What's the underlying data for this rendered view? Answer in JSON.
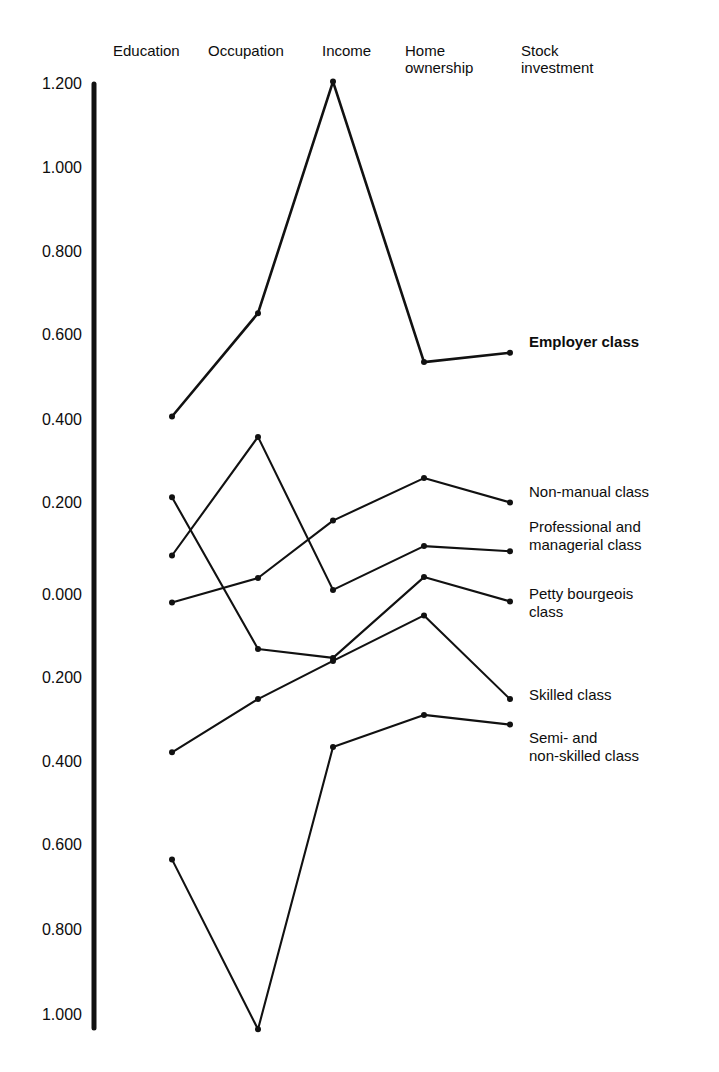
{
  "chart_data": {
    "type": "line",
    "title": "",
    "subtitle": "",
    "xlabel": "",
    "ylabel": "",
    "grid": false,
    "legend_position": "right-of-plot-line-ends",
    "categories": [
      "Education",
      "Occupation",
      "Income",
      "Home ownership",
      "Stock investment"
    ],
    "category_labels_multiline": [
      "Education",
      "Occupation",
      "Income",
      "Home\nownership",
      "Stock\ninvestment"
    ],
    "yticks": [
      "1.200",
      "1.000",
      "0.800",
      "0.600",
      "0.400",
      "0.200",
      "0.000",
      "-0.200",
      "-0.400",
      "-0.600",
      "-0.800",
      "-1.000"
    ],
    "ytick_values": [
      1.2,
      1.0,
      0.8,
      0.6,
      0.4,
      0.2,
      0.0,
      -0.2,
      -0.4,
      -0.6,
      -0.8,
      -1.0
    ],
    "ytick_display": [
      "1.200",
      "1.000",
      "0.800",
      "0.600",
      "0.400",
      "0.200",
      "0.000",
      "0.200",
      "0.400",
      "0.600",
      "0.800",
      "1.000"
    ],
    "ylim": [
      -1.06,
      1.25
    ],
    "axis_color": "#111111",
    "line_color": "#111111",
    "series": [
      {
        "name": "Employer class",
        "bold": true,
        "values": [
          0.42,
          0.663,
          1.208,
          0.548,
          0.57
        ]
      },
      {
        "name": "Non-manual class",
        "bold": false,
        "values": [
          -0.018,
          0.04,
          0.175,
          0.275,
          0.218
        ]
      },
      {
        "name": "Professional and managerial class",
        "bold": false,
        "values": [
          0.093,
          0.372,
          0.012,
          0.115,
          0.103
        ]
      },
      {
        "name": "Petty bourgeois class",
        "bold": false,
        "values": [
          0.23,
          -0.127,
          -0.148,
          0.042,
          -0.015
        ]
      },
      {
        "name": "Skilled class",
        "bold": false,
        "values": [
          -0.37,
          -0.245,
          -0.155,
          -0.048,
          -0.245
        ]
      },
      {
        "name": "Semi- and non-skilled class",
        "bold": false,
        "values": [
          -0.622,
          -1.022,
          -0.358,
          -0.282,
          -0.305
        ]
      }
    ]
  },
  "columns": {
    "c0": "Education",
    "c1": "Occupation",
    "c2": "Income",
    "c3": "Home\nownership",
    "c4": "Stock\ninvestment"
  },
  "yaxis": {
    "t0": "1.200",
    "t1": "1.000",
    "t2": "0.800",
    "t3": "0.600",
    "t4": "0.400",
    "t5": "0.200",
    "t6": "0.000",
    "t7": "0.200",
    "t8": "0.400",
    "t9": "0.600",
    "t10": "0.800",
    "t11": "1.000"
  },
  "legend": {
    "l0": "Employer class",
    "l1": "Non-manual class",
    "l2": "Professional and\nmanagerial class",
    "l3": "Petty bourgeois\nclass",
    "l4": "Skilled class",
    "l5": "Semi- and\nnon-skilled class"
  }
}
